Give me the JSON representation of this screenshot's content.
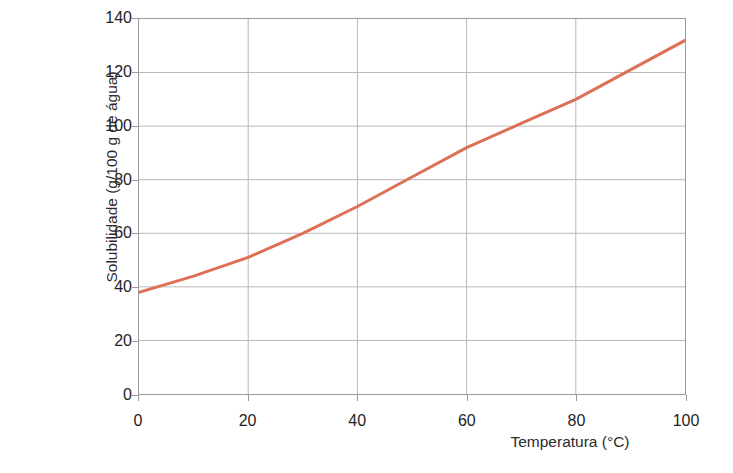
{
  "credit": {
    "text": "MÔNICA R. SUGUIYAMA/Acervo da editora"
  },
  "chart_data": {
    "type": "line",
    "title": "",
    "subtitle": "",
    "xlabel": "Temperatura (°C)",
    "ylabel": "Solubilidade (g/100 g de água)",
    "x": [
      0,
      10,
      20,
      30,
      40,
      50,
      60,
      70,
      80,
      90,
      100
    ],
    "values": [
      38,
      44,
      51,
      60,
      70,
      81,
      92,
      101,
      110,
      121,
      132
    ],
    "series": [
      {
        "name": "Solubilidade",
        "color": "#DD7158",
        "values": [
          38,
          44,
          51,
          60,
          70,
          81,
          92,
          101,
          110,
          121,
          132
        ]
      }
    ],
    "xlim": [
      0,
      100
    ],
    "ylim": [
      0,
      140
    ],
    "xticks": [
      0,
      20,
      40,
      60,
      80,
      100
    ],
    "yticks": [
      0,
      20,
      40,
      60,
      80,
      100,
      120,
      140
    ],
    "xtick_labels": [
      "0",
      "20",
      "40",
      "60",
      "80",
      "100"
    ],
    "ytick_labels": [
      "0",
      "20",
      "40",
      "60",
      "80",
      "100",
      "120",
      "140"
    ],
    "grid": true,
    "grid_color": "#b9b9b9",
    "legend": false,
    "legend_position": "none",
    "line_width": 3,
    "annotations": []
  },
  "colors": {
    "line": "#DD7158",
    "axis": "#9a9a9a",
    "grid": "#b9b9b9",
    "text": "#242424",
    "credit_text": "#8a8a8a",
    "background": "#ffffff"
  }
}
